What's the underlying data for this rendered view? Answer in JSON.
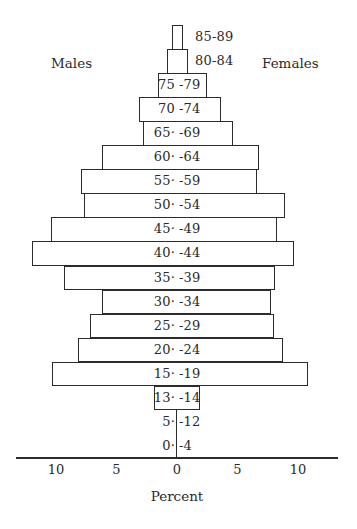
{
  "chart_data": {
    "type": "bar",
    "orientation": "horizontal",
    "subtype": "population-pyramid",
    "title": "",
    "xlabel": "Percent",
    "ylabel": "",
    "xlim": [
      -13,
      13
    ],
    "x_ticks": [
      {
        "value": -10,
        "label": "10"
      },
      {
        "value": -5,
        "label": "5"
      },
      {
        "value": 0,
        "label": "0"
      },
      {
        "value": 5,
        "label": "5"
      },
      {
        "value": 10,
        "label": "10"
      }
    ],
    "grid": false,
    "legend": {
      "left": "Males",
      "right": "Females"
    },
    "categories": [
      "85-89",
      "80-84",
      "75-79",
      "70-74",
      "65-69",
      "60-64",
      "55-59",
      "50-54",
      "45-49",
      "40-44",
      "35-39",
      "30-34",
      "25-29",
      "20-24",
      "15-19",
      "13-14",
      "5-12",
      "0-4"
    ],
    "series": [
      {
        "name": "Males",
        "values": [
          0.4,
          0.8,
          1.6,
          3.1,
          2.8,
          6.2,
          7.9,
          7.7,
          10.4,
          12.0,
          9.3,
          6.2,
          7.2,
          8.2,
          10.3,
          1.9,
          0,
          0
        ]
      },
      {
        "name": "Females",
        "values": [
          0.5,
          0.9,
          2.5,
          3.6,
          4.6,
          6.8,
          6.6,
          8.9,
          8.3,
          9.7,
          8.1,
          7.8,
          8.0,
          8.8,
          10.8,
          1.9,
          0,
          0
        ]
      }
    ],
    "category_labels_display": [
      {
        "left": "",
        "right": "85-89",
        "outside": true
      },
      {
        "left": "",
        "right": "80-84",
        "outside": true
      },
      {
        "left": "75",
        "right": "-79",
        "outside": false
      },
      {
        "left": "70",
        "right": "-74",
        "outside": false
      },
      {
        "left": "65·",
        "right": "-69",
        "outside": false
      },
      {
        "left": "60·",
        "right": "-64",
        "outside": false
      },
      {
        "left": "55·",
        "right": "-59",
        "outside": false
      },
      {
        "left": "50·",
        "right": "-54",
        "outside": false
      },
      {
        "left": "45·",
        "right": "-49",
        "outside": false
      },
      {
        "left": "40·",
        "right": "-44",
        "outside": false
      },
      {
        "left": "35·",
        "right": "-39",
        "outside": false
      },
      {
        "left": "30·",
        "right": "-34",
        "outside": false
      },
      {
        "left": "25·",
        "right": "-29",
        "outside": false
      },
      {
        "left": "20·",
        "right": "-24",
        "outside": false
      },
      {
        "left": "15·",
        "right": "-19",
        "outside": false
      },
      {
        "left": "13·",
        "right": "-14",
        "outside": false
      },
      {
        "left": "5·",
        "right": "-12",
        "outside": false
      },
      {
        "left": "0·",
        "right": "-4",
        "outside": false
      }
    ]
  },
  "labels": {
    "males": "Males",
    "females": "Females",
    "xlabel": "Percent"
  }
}
